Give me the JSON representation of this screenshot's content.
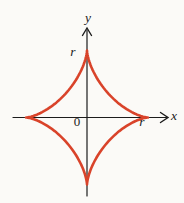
{
  "figure": {
    "background": "#fbfaf7",
    "axes": {
      "color": "#1c1c1c",
      "x_label": "x",
      "y_label": "y",
      "origin_label": "0"
    },
    "curve": {
      "name": "astroid",
      "color": "#d9432a",
      "r_label_top": "r",
      "r_label_right": "r"
    }
  }
}
